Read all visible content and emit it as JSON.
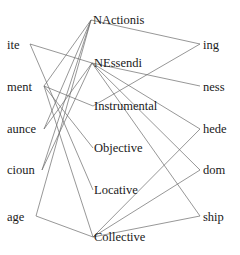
{
  "diagram": {
    "type": "bipartite-mapping",
    "left_nodes": [
      {
        "id": "ite",
        "label": "ite",
        "x": 7,
        "y": 38,
        "ax": 30,
        "ay": 44
      },
      {
        "id": "ment",
        "label": "ment",
        "x": 7,
        "y": 80,
        "ax": 44,
        "ay": 86
      },
      {
        "id": "aunce",
        "label": "aunce",
        "x": 7,
        "y": 122,
        "ax": 44,
        "ay": 129
      },
      {
        "id": "cioun",
        "label": "cioun",
        "x": 7,
        "y": 163,
        "ax": 42,
        "ay": 170
      },
      {
        "id": "age",
        "label": "age",
        "x": 7,
        "y": 210,
        "ax": 36,
        "ay": 216
      }
    ],
    "middle_nodes": [
      {
        "id": "NActionis",
        "label": "NActionis",
        "x": 93,
        "y": 13,
        "ax": 91,
        "ay": 20
      },
      {
        "id": "NEssendi",
        "label": "NEssendi",
        "x": 94,
        "y": 56,
        "ax": 92,
        "ay": 63
      },
      {
        "id": "Instrumental",
        "label": "Instrumental",
        "x": 94,
        "y": 99,
        "ax": 93,
        "ay": 106
      },
      {
        "id": "Objective",
        "label": "Objective",
        "x": 94,
        "y": 141,
        "ax": 93,
        "ay": 148
      },
      {
        "id": "Locative",
        "label": "Locative",
        "x": 94,
        "y": 183,
        "ax": 93,
        "ay": 190
      },
      {
        "id": "Collective",
        "label": "Collective",
        "x": 94,
        "y": 230,
        "ax": 93,
        "ay": 237
      }
    ],
    "right_nodes": [
      {
        "id": "ing",
        "label": "ing",
        "x": 203,
        "y": 38,
        "ax": 200,
        "ay": 44
      },
      {
        "id": "ness",
        "label": "ness",
        "x": 203,
        "y": 80,
        "ax": 200,
        "ay": 86
      },
      {
        "id": "hede",
        "label": "hede",
        "x": 203,
        "y": 122,
        "ax": 200,
        "ay": 129
      },
      {
        "id": "dom",
        "label": "dom",
        "x": 203,
        "y": 163,
        "ax": 200,
        "ay": 170
      },
      {
        "id": "ship",
        "label": "ship",
        "x": 203,
        "y": 210,
        "ax": 200,
        "ay": 216
      }
    ],
    "left_edges": [
      [
        "ite",
        "NEssendi"
      ],
      [
        "ite",
        "Locative"
      ],
      [
        "ment",
        "NActionis"
      ],
      [
        "ment",
        "Instrumental"
      ],
      [
        "ment",
        "Objective"
      ],
      [
        "ment",
        "Collective"
      ],
      [
        "aunce",
        "NActionis"
      ],
      [
        "aunce",
        "NEssendi"
      ],
      [
        "cioun",
        "NActionis"
      ],
      [
        "cioun",
        "NEssendi"
      ],
      [
        "age",
        "NActionis"
      ],
      [
        "age",
        "Collective"
      ]
    ],
    "right_edges": [
      [
        "NActionis",
        "ing"
      ],
      [
        "Instrumental",
        "ing"
      ],
      [
        "NEssendi",
        "ness"
      ],
      [
        "NEssendi",
        "hede"
      ],
      [
        "NEssendi",
        "dom"
      ],
      [
        "NEssendi",
        "ship"
      ],
      [
        "Collective",
        "hede"
      ],
      [
        "Collective",
        "dom"
      ],
      [
        "Collective",
        "ship"
      ]
    ],
    "colors": {
      "edge": "#6a6a6a",
      "text": "#1a1a1a",
      "background": "#ffffff"
    }
  }
}
